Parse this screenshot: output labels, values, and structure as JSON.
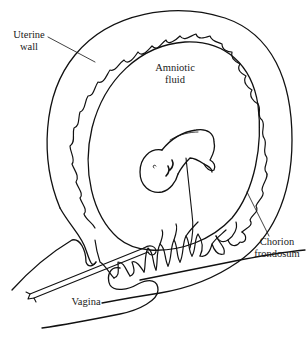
{
  "figure": {
    "stroke_color": "#111111",
    "background": "#ffffff"
  },
  "labels": {
    "uterine_wall": {
      "line1": "Uterine",
      "line2": "wall"
    },
    "amniotic_fluid": {
      "line1": "Amniotic",
      "line2": "fluid"
    },
    "chorion_frondosum": {
      "line1": "Chorion",
      "line2": "frondosum"
    },
    "vagina": {
      "line1": "Vagina"
    }
  },
  "structures": [
    "uterine-wall",
    "chorion-villi",
    "amniotic-sac",
    "embryo",
    "umbilical-cord",
    "cervix",
    "vagina",
    "instrument"
  ]
}
